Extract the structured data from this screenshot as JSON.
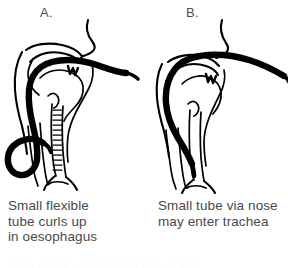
{
  "figure": {
    "background_color": "#ffffff",
    "ink_color": "#000000",
    "text_color": "#4a4a4a",
    "panels": [
      {
        "id": "A",
        "label": "A.",
        "caption_lines": [
          "Small flexible",
          "tube curls up",
          "in oesophagus"
        ],
        "caption_text": "Small flexible tube curls up in oesophagus",
        "illustration": "sagittal-head-neck-with-oral-tube-coiled-in-oesophagus"
      },
      {
        "id": "B",
        "label": "B.",
        "caption_lines": [
          "Small tube via nose",
          "may enter trachea"
        ],
        "caption_text": "Small tube via nose may enter trachea",
        "illustration": "sagittal-head-neck-with-nasal-tube-entering-trachea"
      }
    ],
    "cut_off_line": "may cause damage to the airway"
  }
}
